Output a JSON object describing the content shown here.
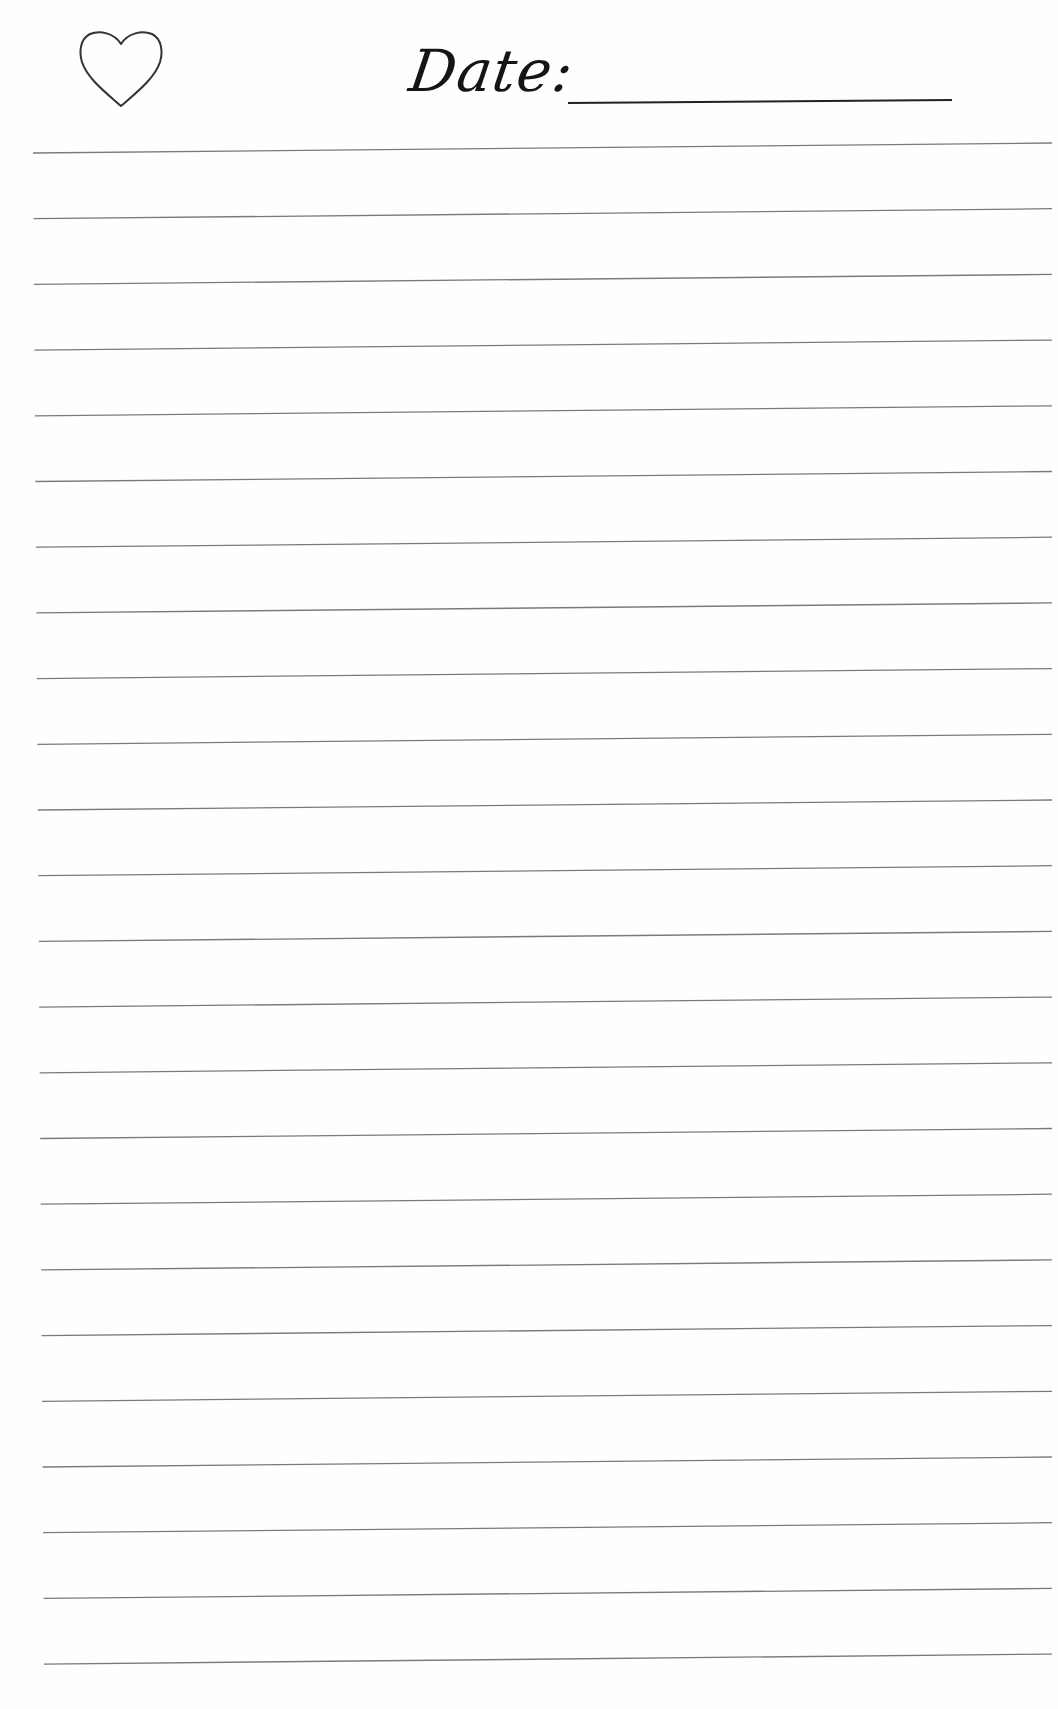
{
  "header": {
    "date_label": "Date:",
    "date_value": "",
    "icon": "heart-outline-icon"
  },
  "colors": {
    "ink": "#151515",
    "rule": "#7a7a7a",
    "heart_stroke": "#333333",
    "paper": "#fefefe"
  },
  "ruled_lines": {
    "count": 24,
    "first_left": [
      33,
      153
    ],
    "first_right": [
      1052,
      143
    ],
    "spacing": 65.7,
    "left_drift_per_line": 0.48,
    "right_drift_per_line": 0.0
  }
}
